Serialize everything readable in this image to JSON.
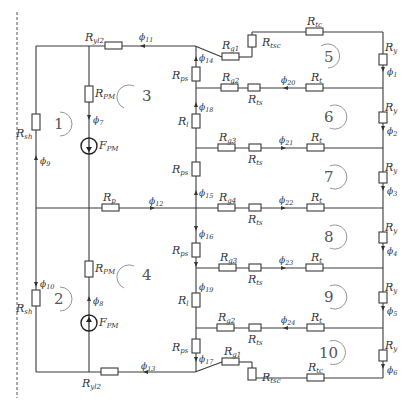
{
  "diagram": {
    "type": "magnetic equivalent circuit",
    "resistors": {
      "Ryl2_top": {
        "sym": "R",
        "sub": "yl2"
      },
      "Ryl2_bot": {
        "sym": "R",
        "sub": "yl2"
      },
      "Rsh_top": {
        "sym": "R",
        "sub": "sh"
      },
      "Rsh_bot": {
        "sym": "R",
        "sub": "sh"
      },
      "RPM_top": {
        "sym": "R",
        "sub": "PM"
      },
      "RPM_bot": {
        "sym": "R",
        "sub": "PM"
      },
      "Rp": {
        "sym": "R",
        "sub": "p"
      },
      "Rg1_top": {
        "sym": "R",
        "sub": "g1"
      },
      "Rg1_bot": {
        "sym": "R",
        "sub": "g1"
      },
      "Rtsc_top": {
        "sym": "R",
        "sub": "tsc"
      },
      "Rtsc_bot": {
        "sym": "R",
        "sub": "tsc"
      },
      "Rtc_top": {
        "sym": "R",
        "sub": "tc"
      },
      "Rtc_bot": {
        "sym": "R",
        "sub": "tc"
      },
      "Rps_1": {
        "sym": "R",
        "sub": "ps"
      },
      "Rps_2": {
        "sym": "R",
        "sub": "ps"
      },
      "Rps_3": {
        "sym": "R",
        "sub": "ps"
      },
      "Rps_4": {
        "sym": "R",
        "sub": "ps"
      },
      "Rl_top": {
        "sym": "R",
        "sub": "l"
      },
      "Rl_bot": {
        "sym": "R",
        "sub": "l"
      },
      "Rg2_top": {
        "sym": "R",
        "sub": "g2"
      },
      "Rg3_top": {
        "sym": "R",
        "sub": "g3"
      },
      "Rg4": {
        "sym": "R",
        "sub": "g4"
      },
      "Rg3_bot": {
        "sym": "R",
        "sub": "g3"
      },
      "Rg2_bot": {
        "sym": "R",
        "sub": "g2"
      },
      "Rts_1": {
        "sym": "R",
        "sub": "ts"
      },
      "Rts_2": {
        "sym": "R",
        "sub": "ts"
      },
      "Rts_3": {
        "sym": "R",
        "sub": "ts"
      },
      "Rts_4": {
        "sym": "R",
        "sub": "ts"
      },
      "Rts_5": {
        "sym": "R",
        "sub": "ts"
      },
      "Rt_1": {
        "sym": "R",
        "sub": "t"
      },
      "Rt_2": {
        "sym": "R",
        "sub": "t"
      },
      "Rt_3": {
        "sym": "R",
        "sub": "t"
      },
      "Rt_4": {
        "sym": "R",
        "sub": "t"
      },
      "Rt_5": {
        "sym": "R",
        "sub": "t"
      },
      "Ry_1": {
        "sym": "R",
        "sub": "y"
      },
      "Ry_2": {
        "sym": "R",
        "sub": "y"
      },
      "Ry_3": {
        "sym": "R",
        "sub": "y"
      },
      "Ry_4": {
        "sym": "R",
        "sub": "y"
      },
      "Ry_5": {
        "sym": "R",
        "sub": "y"
      },
      "Ry_6": {
        "sym": "R",
        "sub": "y"
      }
    },
    "sources": {
      "FPM_top": {
        "sym": "F",
        "sub": "PM"
      },
      "FPM_bot": {
        "sym": "F",
        "sub": "PM"
      }
    },
    "fluxes": {
      "phi1": {
        "sym": "ϕ",
        "sub": "1"
      },
      "phi2": {
        "sym": "ϕ",
        "sub": "2"
      },
      "phi3": {
        "sym": "ϕ",
        "sub": "3"
      },
      "phi4": {
        "sym": "ϕ",
        "sub": "4"
      },
      "phi5": {
        "sym": "ϕ",
        "sub": "5"
      },
      "phi6": {
        "sym": "ϕ",
        "sub": "6"
      },
      "phi7": {
        "sym": "ϕ",
        "sub": "7"
      },
      "phi8": {
        "sym": "ϕ",
        "sub": "8"
      },
      "phi9": {
        "sym": "ϕ",
        "sub": "9"
      },
      "phi10": {
        "sym": "ϕ",
        "sub": "10"
      },
      "phi11": {
        "sym": "ϕ",
        "sub": "11"
      },
      "phi12": {
        "sym": "ϕ",
        "sub": "12"
      },
      "phi13": {
        "sym": "ϕ",
        "sub": "13"
      },
      "phi14": {
        "sym": "ϕ",
        "sub": "14"
      },
      "phi15": {
        "sym": "ϕ",
        "sub": "15"
      },
      "phi16": {
        "sym": "ϕ",
        "sub": "16"
      },
      "phi17": {
        "sym": "ϕ",
        "sub": "17"
      },
      "phi18": {
        "sym": "ϕ",
        "sub": "18"
      },
      "phi19": {
        "sym": "ϕ",
        "sub": "19"
      },
      "phi20": {
        "sym": "ϕ",
        "sub": "20"
      },
      "phi21": {
        "sym": "ϕ",
        "sub": "21"
      },
      "phi22": {
        "sym": "ϕ",
        "sub": "22"
      },
      "phi23": {
        "sym": "ϕ",
        "sub": "23"
      },
      "phi24": {
        "sym": "ϕ",
        "sub": "24"
      }
    },
    "loops": [
      "1",
      "2",
      "3",
      "4",
      "5",
      "6",
      "7",
      "8",
      "9",
      "10"
    ]
  }
}
